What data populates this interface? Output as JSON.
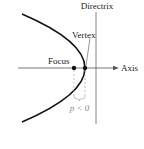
{
  "diagram": {
    "labels": {
      "directrix": "Directrix",
      "vertex": "Vertex",
      "focus": "Focus",
      "axis": "Axis",
      "p_condition": "p < 0"
    },
    "colors": {
      "curve": "#111111",
      "lines": "#555555",
      "dashed": "#999999",
      "text": "#222222",
      "p_text": "#888888"
    }
  }
}
